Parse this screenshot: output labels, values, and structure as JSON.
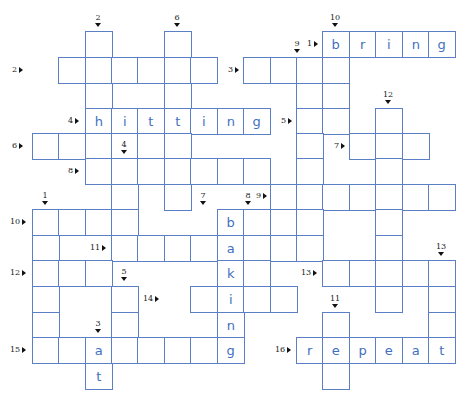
{
  "puzzle": {
    "type": "crossword",
    "colors": {
      "grid_line": "#5b7fc4",
      "letter": "#3f6fc0",
      "label": "#222222"
    },
    "grid": {
      "col_x": [
        32,
        58,
        85,
        111,
        137,
        164,
        190,
        217,
        243,
        270,
        296,
        322,
        349,
        375,
        402,
        428
      ],
      "row_y": [
        31,
        57,
        83,
        108,
        133,
        158,
        184,
        209,
        235,
        260,
        286,
        312,
        337,
        363
      ]
    },
    "cells": [
      {
        "r": 0,
        "c": 2,
        "l": ""
      },
      {
        "r": 0,
        "c": 5,
        "l": ""
      },
      {
        "r": 0,
        "c": 11,
        "l": "b"
      },
      {
        "r": 0,
        "c": 12,
        "l": "r"
      },
      {
        "r": 0,
        "c": 13,
        "l": "i"
      },
      {
        "r": 0,
        "c": 14,
        "l": "n"
      },
      {
        "r": 0,
        "c": 15,
        "l": "g"
      },
      {
        "r": 1,
        "c": 1,
        "l": ""
      },
      {
        "r": 1,
        "c": 2,
        "l": ""
      },
      {
        "r": 1,
        "c": 3,
        "l": ""
      },
      {
        "r": 1,
        "c": 4,
        "l": ""
      },
      {
        "r": 1,
        "c": 5,
        "l": ""
      },
      {
        "r": 1,
        "c": 6,
        "l": ""
      },
      {
        "r": 1,
        "c": 8,
        "l": ""
      },
      {
        "r": 1,
        "c": 9,
        "l": ""
      },
      {
        "r": 1,
        "c": 10,
        "l": ""
      },
      {
        "r": 1,
        "c": 11,
        "l": ""
      },
      {
        "r": 2,
        "c": 2,
        "l": ""
      },
      {
        "r": 2,
        "c": 5,
        "l": ""
      },
      {
        "r": 2,
        "c": 10,
        "l": ""
      },
      {
        "r": 2,
        "c": 11,
        "l": ""
      },
      {
        "r": 3,
        "c": 2,
        "l": "h"
      },
      {
        "r": 3,
        "c": 3,
        "l": "i"
      },
      {
        "r": 3,
        "c": 4,
        "l": "t"
      },
      {
        "r": 3,
        "c": 5,
        "l": "t"
      },
      {
        "r": 3,
        "c": 6,
        "l": "i"
      },
      {
        "r": 3,
        "c": 7,
        "l": "n"
      },
      {
        "r": 3,
        "c": 8,
        "l": "g"
      },
      {
        "r": 3,
        "c": 10,
        "l": ""
      },
      {
        "r": 3,
        "c": 11,
        "l": ""
      },
      {
        "r": 3,
        "c": 13,
        "l": ""
      },
      {
        "r": 4,
        "c": 0,
        "l": ""
      },
      {
        "r": 4,
        "c": 1,
        "l": ""
      },
      {
        "r": 4,
        "c": 2,
        "l": ""
      },
      {
        "r": 4,
        "c": 3,
        "l": ""
      },
      {
        "r": 4,
        "c": 4,
        "l": ""
      },
      {
        "r": 4,
        "c": 5,
        "l": ""
      },
      {
        "r": 4,
        "c": 10,
        "l": ""
      },
      {
        "r": 4,
        "c": 12,
        "l": ""
      },
      {
        "r": 4,
        "c": 13,
        "l": ""
      },
      {
        "r": 4,
        "c": 14,
        "l": ""
      },
      {
        "r": 5,
        "c": 2,
        "l": ""
      },
      {
        "r": 5,
        "c": 3,
        "l": ""
      },
      {
        "r": 5,
        "c": 4,
        "l": ""
      },
      {
        "r": 5,
        "c": 5,
        "l": ""
      },
      {
        "r": 5,
        "c": 6,
        "l": ""
      },
      {
        "r": 5,
        "c": 7,
        "l": ""
      },
      {
        "r": 5,
        "c": 8,
        "l": ""
      },
      {
        "r": 5,
        "c": 10,
        "l": ""
      },
      {
        "r": 5,
        "c": 13,
        "l": ""
      },
      {
        "r": 6,
        "c": 3,
        "l": ""
      },
      {
        "r": 6,
        "c": 5,
        "l": ""
      },
      {
        "r": 6,
        "c": 9,
        "l": ""
      },
      {
        "r": 6,
        "c": 10,
        "l": ""
      },
      {
        "r": 6,
        "c": 11,
        "l": ""
      },
      {
        "r": 6,
        "c": 12,
        "l": ""
      },
      {
        "r": 6,
        "c": 13,
        "l": ""
      },
      {
        "r": 6,
        "c": 14,
        "l": ""
      },
      {
        "r": 6,
        "c": 15,
        "l": ""
      },
      {
        "r": 7,
        "c": 0,
        "l": ""
      },
      {
        "r": 7,
        "c": 1,
        "l": ""
      },
      {
        "r": 7,
        "c": 2,
        "l": ""
      },
      {
        "r": 7,
        "c": 3,
        "l": ""
      },
      {
        "r": 7,
        "c": 7,
        "l": "b"
      },
      {
        "r": 7,
        "c": 8,
        "l": ""
      },
      {
        "r": 7,
        "c": 9,
        "l": ""
      },
      {
        "r": 7,
        "c": 10,
        "l": ""
      },
      {
        "r": 7,
        "c": 13,
        "l": ""
      },
      {
        "r": 8,
        "c": 0,
        "l": ""
      },
      {
        "r": 8,
        "c": 3,
        "l": ""
      },
      {
        "r": 8,
        "c": 4,
        "l": ""
      },
      {
        "r": 8,
        "c": 5,
        "l": ""
      },
      {
        "r": 8,
        "c": 6,
        "l": ""
      },
      {
        "r": 8,
        "c": 7,
        "l": "a"
      },
      {
        "r": 8,
        "c": 8,
        "l": ""
      },
      {
        "r": 8,
        "c": 9,
        "l": ""
      },
      {
        "r": 8,
        "c": 10,
        "l": ""
      },
      {
        "r": 8,
        "c": 13,
        "l": ""
      },
      {
        "r": 9,
        "c": 0,
        "l": ""
      },
      {
        "r": 9,
        "c": 1,
        "l": ""
      },
      {
        "r": 9,
        "c": 2,
        "l": ""
      },
      {
        "r": 9,
        "c": 7,
        "l": "k"
      },
      {
        "r": 9,
        "c": 8,
        "l": ""
      },
      {
        "r": 9,
        "c": 11,
        "l": ""
      },
      {
        "r": 9,
        "c": 12,
        "l": ""
      },
      {
        "r": 9,
        "c": 13,
        "l": ""
      },
      {
        "r": 9,
        "c": 14,
        "l": ""
      },
      {
        "r": 9,
        "c": 15,
        "l": ""
      },
      {
        "r": 10,
        "c": 0,
        "l": ""
      },
      {
        "r": 10,
        "c": 3,
        "l": ""
      },
      {
        "r": 10,
        "c": 6,
        "l": ""
      },
      {
        "r": 10,
        "c": 7,
        "l": "i"
      },
      {
        "r": 10,
        "c": 8,
        "l": ""
      },
      {
        "r": 10,
        "c": 9,
        "l": ""
      },
      {
        "r": 10,
        "c": 13,
        "l": ""
      },
      {
        "r": 10,
        "c": 15,
        "l": ""
      },
      {
        "r": 11,
        "c": 0,
        "l": ""
      },
      {
        "r": 11,
        "c": 3,
        "l": ""
      },
      {
        "r": 11,
        "c": 7,
        "l": "n"
      },
      {
        "r": 11,
        "c": 11,
        "l": ""
      },
      {
        "r": 11,
        "c": 15,
        "l": ""
      },
      {
        "r": 12,
        "c": 0,
        "l": ""
      },
      {
        "r": 12,
        "c": 1,
        "l": ""
      },
      {
        "r": 12,
        "c": 2,
        "l": "a"
      },
      {
        "r": 12,
        "c": 3,
        "l": ""
      },
      {
        "r": 12,
        "c": 4,
        "l": ""
      },
      {
        "r": 12,
        "c": 5,
        "l": ""
      },
      {
        "r": 12,
        "c": 6,
        "l": ""
      },
      {
        "r": 12,
        "c": 7,
        "l": "g"
      },
      {
        "r": 12,
        "c": 10,
        "l": "r"
      },
      {
        "r": 12,
        "c": 11,
        "l": "e"
      },
      {
        "r": 12,
        "c": 12,
        "l": "p"
      },
      {
        "r": 12,
        "c": 13,
        "l": "e"
      },
      {
        "r": 12,
        "c": 14,
        "l": "a"
      },
      {
        "r": 12,
        "c": 15,
        "l": "t"
      },
      {
        "r": 13,
        "c": 2,
        "l": "t"
      },
      {
        "r": 13,
        "c": 11,
        "l": ""
      }
    ],
    "across_labels": [
      {
        "n": "1",
        "x": 307,
        "y": 40
      },
      {
        "n": "2",
        "x": 12,
        "y": 66
      },
      {
        "n": "3",
        "x": 228,
        "y": 66
      },
      {
        "n": "4",
        "x": 68,
        "y": 117
      },
      {
        "n": "5",
        "x": 281,
        "y": 117
      },
      {
        "n": "6",
        "x": 12,
        "y": 142
      },
      {
        "n": "7",
        "x": 334,
        "y": 142
      },
      {
        "n": "8",
        "x": 68,
        "y": 167
      },
      {
        "n": "9",
        "x": 256,
        "y": 192
      },
      {
        "n": "10",
        "x": 10,
        "y": 218
      },
      {
        "n": "11",
        "x": 90,
        "y": 244
      },
      {
        "n": "12",
        "x": 10,
        "y": 269
      },
      {
        "n": "13",
        "x": 301,
        "y": 269
      },
      {
        "n": "14",
        "x": 143,
        "y": 295
      },
      {
        "n": "15",
        "x": 10,
        "y": 346
      },
      {
        "n": "16",
        "x": 275,
        "y": 346
      }
    ],
    "down_labels": [
      {
        "n": "1",
        "x": 37,
        "y": 192
      },
      {
        "n": "2",
        "x": 90,
        "y": 14
      },
      {
        "n": "3",
        "x": 90,
        "y": 320
      },
      {
        "n": "4",
        "x": 116,
        "y": 141
      },
      {
        "n": "5",
        "x": 116,
        "y": 268
      },
      {
        "n": "6",
        "x": 169,
        "y": 14
      },
      {
        "n": "7",
        "x": 195,
        "y": 192
      },
      {
        "n": "8",
        "x": 240,
        "y": 192
      },
      {
        "n": "9",
        "x": 289,
        "y": 40
      },
      {
        "n": "10",
        "x": 327,
        "y": 14
      },
      {
        "n": "11",
        "x": 327,
        "y": 295
      },
      {
        "n": "12",
        "x": 380,
        "y": 91
      },
      {
        "n": "13",
        "x": 433,
        "y": 243
      }
    ]
  }
}
